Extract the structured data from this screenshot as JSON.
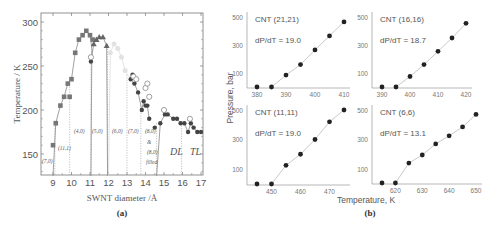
{
  "chart_data": [
    {
      "panel": "(a)",
      "type": "scatter",
      "xlabel": "SWNT diameter /Å",
      "ylabel": "Temperature / K",
      "xlim": [
        8.5,
        17.1
      ],
      "ylim": [
        126,
        310
      ],
      "xticks": [
        9,
        10,
        11,
        12,
        13,
        14,
        15,
        16,
        17
      ],
      "yticks": [
        150,
        200,
        250,
        300
      ],
      "region_labels": [
        "(7,0)",
        "(11,1)",
        "(4,0)",
        "(5,0)",
        "(6,0)",
        "(7,0)",
        "(8,0)",
        "&",
        "(8,0)",
        "filled",
        "DL",
        "TL"
      ],
      "boundaries_x": [
        9.1,
        9.9,
        11.05,
        11.95,
        13.0,
        13.75,
        14.6,
        15.95
      ],
      "series": [
        {
          "name": "squares",
          "marker": "square",
          "points": [
            [
              9.0,
              160
            ],
            [
              9.15,
              185
            ],
            [
              9.4,
              205
            ],
            [
              9.6,
              215
            ],
            [
              9.8,
              230
            ],
            [
              9.9,
              215
            ],
            [
              10.0,
              235
            ],
            [
              10.2,
              265
            ],
            [
              10.4,
              280
            ],
            [
              10.6,
              285
            ],
            [
              10.8,
              290
            ],
            [
              11.0,
              285
            ],
            [
              11.15,
              280
            ]
          ]
        },
        {
          "name": "triangles",
          "marker": "triangle",
          "points": [
            [
              11.2,
              275
            ],
            [
              11.35,
              280
            ],
            [
              11.5,
              283
            ],
            [
              11.7,
              283
            ],
            [
              11.9,
              273
            ]
          ]
        },
        {
          "name": "faded",
          "marker": "circle-faded",
          "points": [
            [
              12.1,
              265
            ],
            [
              12.3,
              275
            ],
            [
              12.5,
              270
            ],
            [
              12.7,
              260
            ],
            [
              12.9,
              245
            ]
          ]
        },
        {
          "name": "filled-circles",
          "marker": "circle",
          "points": [
            [
              11.05,
              255
            ],
            [
              13.2,
              235
            ],
            [
              13.3,
              240
            ],
            [
              13.4,
              230
            ],
            [
              13.6,
              220
            ],
            [
              13.8,
              200
            ],
            [
              13.9,
              210
            ],
            [
              14.0,
              205
            ],
            [
              14.1,
              205
            ],
            [
              14.2,
              190
            ],
            [
              14.5,
              180
            ],
            [
              14.8,
              185
            ],
            [
              15.05,
              195
            ],
            [
              15.2,
              195
            ],
            [
              15.5,
              190
            ],
            [
              15.7,
              190
            ],
            [
              15.9,
              185
            ],
            [
              16.1,
              185
            ],
            [
              16.3,
              175
            ],
            [
              16.45,
              185
            ],
            [
              16.6,
              180
            ],
            [
              16.8,
              175
            ],
            [
              17.0,
              175
            ]
          ]
        },
        {
          "name": "open-circles",
          "marker": "open-circle",
          "points": [
            [
              11.05,
              260
            ],
            [
              13.35,
              238
            ],
            [
              13.5,
              235
            ],
            [
              14.0,
              225
            ],
            [
              14.1,
              230
            ],
            [
              14.2,
              215
            ],
            [
              15.0,
              200
            ],
            [
              16.4,
              190
            ]
          ]
        }
      ]
    },
    {
      "panel": "(b)",
      "type": "line",
      "xlabel": "Temperature, K",
      "ylabel": "Pressure, bar",
      "subplots": [
        {
          "title": "CNT (21,21)",
          "slope_label": "dP/dT = 19.0",
          "xticks": [
            380,
            390,
            400,
            410
          ],
          "yticks": [
            100,
            300,
            500
          ],
          "x": [
            380,
            385,
            390,
            395,
            400,
            405,
            410
          ],
          "y": [
            0,
            0,
            85,
            160,
            265,
            365,
            465
          ]
        },
        {
          "title": "CNT (16,16)",
          "slope_label": "dP/dT = 18.7",
          "xticks": [
            390,
            400,
            410,
            420
          ],
          "yticks": [
            100,
            300,
            500
          ],
          "x": [
            390,
            395,
            400,
            405,
            410,
            415,
            420
          ],
          "y": [
            0,
            0,
            75,
            160,
            255,
            350,
            455
          ]
        },
        {
          "title": "CNT (11,11)",
          "slope_label": "dP/dT = 19.0",
          "xticks": [
            450,
            460,
            470
          ],
          "yticks": [
            100,
            300,
            500
          ],
          "x": [
            445,
            450,
            455,
            460,
            465,
            470,
            475
          ],
          "y": [
            0,
            0,
            125,
            200,
            300,
            420,
            500
          ]
        },
        {
          "title": "CNT (6,6)",
          "slope_label": "dP/dT = 13.1",
          "xticks": [
            620,
            630,
            640,
            650
          ],
          "yticks": [
            100,
            300,
            500
          ],
          "x": [
            615,
            620,
            625,
            630,
            635,
            640,
            645,
            650
          ],
          "y": [
            0,
            0,
            140,
            195,
            270,
            325,
            385,
            470
          ]
        }
      ]
    }
  ],
  "labels": {
    "panel_a": "(a)",
    "panel_b": "(b)",
    "a_xlabel": "SWNT diameter /Å",
    "a_ylabel": "Temperature / K",
    "b_xlabel": "Temperature, K",
    "b_ylabel": "Pressure, bar"
  }
}
